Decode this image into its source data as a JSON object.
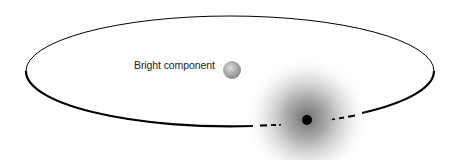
{
  "diagram": {
    "labels": {
      "bright_component": "Bright component"
    },
    "elements": {
      "orbit": {
        "shape": "ellipse",
        "cx": 230,
        "cy": 71,
        "rx": 204,
        "ry": 55,
        "stroke": "#000000"
      },
      "bright_component": {
        "shape": "sphere",
        "cx": 232,
        "cy": 70,
        "r": 9,
        "color": "#9a9a9a"
      },
      "companion": {
        "shape": "dot",
        "cx": 307,
        "cy": 120,
        "r": 5,
        "color": "#000000"
      },
      "cloud": {
        "shape": "radial-gradient",
        "cx": 307,
        "cy": 118,
        "r": 62,
        "color": "#555555"
      }
    },
    "colors": {
      "background": "#ffffff",
      "orbit": "#000000",
      "sphere_light": "#e0e0e0",
      "sphere_dark": "#8a8a8a",
      "cloud_core": "#6a6a6a"
    }
  }
}
